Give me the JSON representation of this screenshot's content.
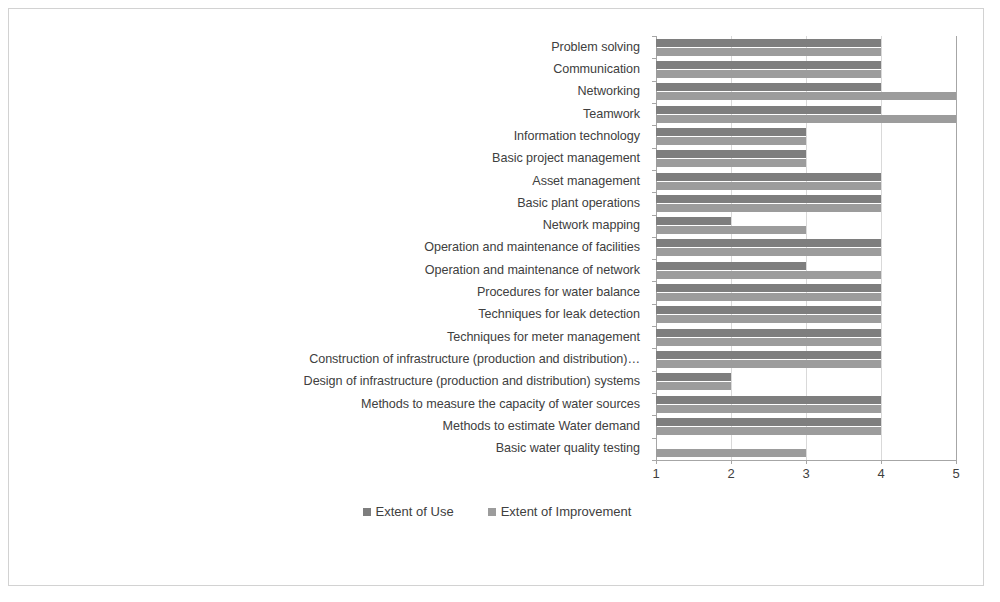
{
  "chart_data": {
    "type": "bar",
    "orientation": "horizontal",
    "title": "",
    "xlabel": "",
    "ylabel": "",
    "xlim": [
      1,
      5
    ],
    "xticks": [
      "1",
      "2",
      "3",
      "4",
      "5"
    ],
    "grid": true,
    "legend_position": "bottom",
    "categories": [
      "Problem solving",
      "Communication",
      "Networking",
      "Teamwork",
      "Information technology",
      "Basic project management",
      "Asset management",
      "Basic plant operations",
      "Network mapping",
      "Operation and maintenance of facilities",
      "Operation and maintenance of network",
      "Procedures for water balance",
      "Techniques  for leak detection",
      "Techniques for meter management",
      "Construction of infrastructure (production and distribution)…",
      "Design of infrastructure (production and distribution) systems",
      "Methods to measure the capacity of water sources",
      "Methods to estimate Water demand",
      "Basic water quality testing"
    ],
    "series": [
      {
        "name": "Extent of Use",
        "color": "#7e7e7e",
        "values": [
          4,
          4,
          4,
          4,
          3,
          3,
          4,
          4,
          2,
          4,
          3,
          4,
          4,
          4,
          4,
          2,
          4,
          4,
          1
        ]
      },
      {
        "name": "Extent of Improvement",
        "color": "#9c9c9c",
        "values": [
          4,
          4,
          5,
          5,
          3,
          3,
          4,
          4,
          3,
          4,
          4,
          4,
          4,
          4,
          4,
          2,
          4,
          4,
          3
        ]
      }
    ]
  },
  "legend": {
    "items": [
      {
        "label": "Extent of Use"
      },
      {
        "label": "Extent of Improvement"
      }
    ]
  }
}
